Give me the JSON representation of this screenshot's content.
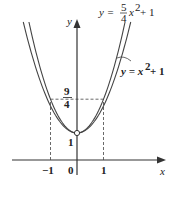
{
  "diagram": {
    "type": "function-graph",
    "axes": {
      "x_label": "x",
      "y_label": "y",
      "origin_label": "0",
      "x_ticks": [
        "-1",
        "1"
      ],
      "y_ticks": [
        "1"
      ]
    },
    "curves": [
      {
        "name": "outer",
        "equation": "y = x² + 1",
        "a": 1,
        "c": 1
      },
      {
        "name": "inner",
        "equation": "y = 5/4 x² + 1",
        "a": 1.25,
        "c": 1
      }
    ],
    "labels": {
      "inner_eq_lhs": "y =",
      "inner_eq_num": "5",
      "inner_eq_den": "4",
      "inner_eq_rhs": "x",
      "inner_eq_exp": "2",
      "inner_eq_tail": "+ 1",
      "outer_eq_lhs": "y = x",
      "outer_eq_exp": "2",
      "outer_eq_tail": "+ 1",
      "y_frac_num": "9",
      "y_frac_den": "4",
      "minus_one": "−1",
      "one_x": "1",
      "one_y": "1",
      "zero": "0",
      "x": "x",
      "y": "y"
    },
    "markers": [
      {
        "type": "open-circle",
        "x": 0,
        "y": 1
      }
    ],
    "dashed_guides": [
      {
        "from": [
          -1,
          2.25
        ],
        "to": [
          1,
          2.25
        ]
      },
      {
        "from": [
          -1,
          0
        ],
        "to": [
          -1,
          2.25
        ]
      },
      {
        "from": [
          1,
          0
        ],
        "to": [
          1,
          2.25
        ]
      }
    ]
  }
}
